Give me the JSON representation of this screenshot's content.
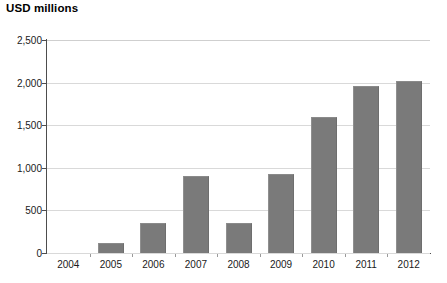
{
  "chart_data": {
    "type": "bar",
    "title": "USD millions",
    "xlabel": "",
    "ylabel": "USD millions",
    "categories": [
      "2004",
      "2005",
      "2006",
      "2007",
      "2008",
      "2009",
      "2010",
      "2011",
      "2012"
    ],
    "values": [
      0,
      120,
      350,
      900,
      350,
      930,
      1600,
      1960,
      2020
    ],
    "ylim": [
      0,
      2500
    ],
    "ytick_labels": [
      "0",
      "500",
      "1,000",
      "1,500",
      "2,000",
      "2,500"
    ],
    "ytick_values": [
      0,
      500,
      1000,
      1500,
      2000,
      2500
    ],
    "grid": true,
    "legend": "none",
    "bar_color": "#7a7a7a",
    "gridline_color": "#d9d9d9",
    "axis_color": "#4d4d4d",
    "background_color": "#ffffff"
  }
}
